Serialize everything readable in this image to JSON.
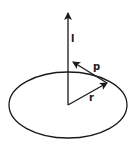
{
  "diagram": {
    "labels": {
      "angular_momentum": "l",
      "momentum": "p",
      "position": "r"
    },
    "colors": {
      "stroke": "#1a1a1a",
      "background": "#ffffff"
    }
  }
}
